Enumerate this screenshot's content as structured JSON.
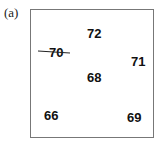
{
  "panel_label": "(a)",
  "values": [
    {
      "label": "72",
      "x": 87,
      "y": 27
    },
    {
      "label": "70",
      "x": 49,
      "y": 46
    },
    {
      "label": "71",
      "x": 131,
      "y": 55
    },
    {
      "label": "68",
      "x": 87,
      "y": 71
    },
    {
      "label": "66",
      "x": 44,
      "y": 109
    },
    {
      "label": "69",
      "x": 127,
      "y": 111
    }
  ],
  "strike_line": {
    "x1": 38,
    "y1": 51,
    "x2": 70,
    "y2": 53,
    "color": "#222222"
  }
}
